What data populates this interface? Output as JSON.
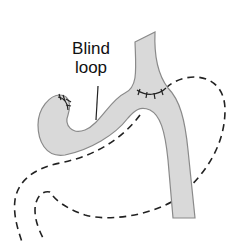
{
  "diagram": {
    "labels": {
      "blind_loop_line1": "Blind",
      "blind_loop_line2": "loop"
    },
    "colors": {
      "tube_fill": "#d9d9d9",
      "tube_stroke": "#8a8a8a",
      "dashed_outline": "#222222",
      "sutures": "#222222",
      "background": "#ffffff"
    }
  }
}
